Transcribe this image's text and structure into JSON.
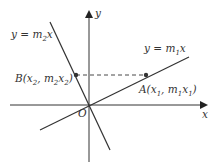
{
  "diagram": {
    "axes": {
      "x_label": "x",
      "y_label": "y",
      "origin_label": "O"
    },
    "lines": [
      {
        "id": "line1",
        "equation_prefix": "y = m",
        "subscript": "1",
        "suffix": "x"
      },
      {
        "id": "line2",
        "equation_prefix": "y = m",
        "subscript": "2",
        "suffix": "x"
      }
    ],
    "points": {
      "A": {
        "name": "A",
        "open": "(x",
        "s1": "1",
        "mid": ", m",
        "s2": "1",
        "x": "x",
        "s3": "1",
        "close": ")"
      },
      "B": {
        "name": "B",
        "open": "(x",
        "s1": "2",
        "mid": ", m",
        "s2": "2",
        "x": "x",
        "s3": "2",
        "close": ")"
      }
    },
    "colors": {
      "line": "#333333",
      "background": "#ffffff"
    }
  }
}
